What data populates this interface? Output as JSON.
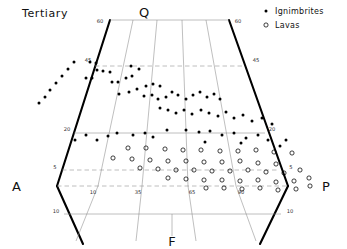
{
  "figure": {
    "title": "Tertiary",
    "type": "qapf-ternary-double-triangle"
  },
  "corners": {
    "q": "Q",
    "a": "A",
    "p": "P",
    "f": "F"
  },
  "legend": {
    "position": "top-right",
    "entries": [
      {
        "label": "Ignimbrites",
        "marker": "filled-dot",
        "color": "#000000"
      },
      {
        "label": "Lavas",
        "marker": "open-circle",
        "color": "#000000"
      }
    ]
  },
  "axis_ticks": {
    "top_left": "60",
    "top_right": "60",
    "left_upper": "45",
    "left_mid": "20",
    "left_lower": "5",
    "left_bottom": "10",
    "right_upper": "45",
    "right_mid": "20",
    "right_lower": "5",
    "right_bottom": "10",
    "inner_left": "10",
    "inner_mid_left": "35",
    "inner_mid_right": "65",
    "inner_right": "90"
  },
  "chart_data": {
    "type": "scatter",
    "title": "Tertiary",
    "xlabel": "",
    "ylabel": "",
    "grid": true,
    "axis_system": "QAPF ternary (Streckeisen)",
    "tick_labels": [
      "60",
      "45",
      "20",
      "5",
      "10",
      "35",
      "65",
      "90"
    ],
    "series": [
      {
        "name": "Ignimbrites",
        "marker": "filled-dot",
        "count": 52,
        "points": [
          [
            39,
            103
          ],
          [
            45,
            97
          ],
          [
            50,
            90
          ],
          [
            56,
            83
          ],
          [
            62,
            76
          ],
          [
            68,
            69
          ],
          [
            74,
            62
          ],
          [
            90,
            62
          ],
          [
            96,
            63
          ],
          [
            97,
            70
          ],
          [
            103,
            71
          ],
          [
            110,
            72
          ],
          [
            86,
            78
          ],
          [
            92,
            78
          ],
          [
            112,
            82
          ],
          [
            118,
            82
          ],
          [
            126,
            78
          ],
          [
            132,
            76
          ],
          [
            131,
            66
          ],
          [
            139,
            69
          ],
          [
            119,
            94
          ],
          [
            129,
            92
          ],
          [
            137,
            89
          ],
          [
            146,
            86
          ],
          [
            153,
            84
          ],
          [
            160,
            86
          ],
          [
            144,
            96
          ],
          [
            152,
            95
          ],
          [
            158,
            99
          ],
          [
            166,
            97
          ],
          [
            172,
            92
          ],
          [
            178,
            95
          ],
          [
            186,
            99
          ],
          [
            193,
            95
          ],
          [
            200,
            92
          ],
          [
            207,
            97
          ],
          [
            214,
            94
          ],
          [
            220,
            99
          ],
          [
            160,
            108
          ],
          [
            168,
            110
          ],
          [
            176,
            113
          ],
          [
            184,
            110
          ],
          [
            192,
            114
          ],
          [
            201,
            110
          ],
          [
            209,
            113
          ],
          [
            218,
            116
          ],
          [
            226,
            112
          ],
          [
            234,
            118
          ],
          [
            243,
            115
          ],
          [
            252,
            121
          ],
          [
            262,
            118
          ],
          [
            272,
            124
          ],
          [
            286,
            140
          ],
          [
            167,
            130
          ],
          [
            186,
            130
          ],
          [
            199,
            132
          ],
          [
            210,
            131
          ],
          [
            222,
            135
          ],
          [
            234,
            133
          ],
          [
            246,
            138
          ],
          [
            258,
            135
          ],
          [
            268,
            140
          ],
          [
            280,
            146
          ],
          [
            133,
            135
          ],
          [
            145,
            133
          ],
          [
            153,
            137
          ],
          [
            108,
            136
          ],
          [
            117,
            133
          ],
          [
            97,
            140
          ],
          [
            86,
            135
          ],
          [
            75,
            140
          ],
          [
            205,
            142
          ],
          [
            241,
            143
          ]
        ]
      },
      {
        "name": "Lavas",
        "marker": "open-circle",
        "count": 46,
        "points": [
          [
            128,
            148
          ],
          [
            146,
            148
          ],
          [
            165,
            149
          ],
          [
            183,
            150
          ],
          [
            201,
            150
          ],
          [
            220,
            151
          ],
          [
            238,
            151
          ],
          [
            256,
            150
          ],
          [
            274,
            152
          ],
          [
            292,
            153
          ],
          [
            113,
            158
          ],
          [
            132,
            159
          ],
          [
            150,
            160
          ],
          [
            168,
            161
          ],
          [
            186,
            161
          ],
          [
            204,
            162
          ],
          [
            222,
            162
          ],
          [
            240,
            161
          ],
          [
            258,
            163
          ],
          [
            276,
            164
          ],
          [
            140,
            168
          ],
          [
            158,
            169
          ],
          [
            176,
            170
          ],
          [
            194,
            170
          ],
          [
            212,
            171
          ],
          [
            230,
            171
          ],
          [
            248,
            170
          ],
          [
            266,
            172
          ],
          [
            284,
            173
          ],
          [
            300,
            170
          ],
          [
            168,
            178
          ],
          [
            186,
            179
          ],
          [
            204,
            180
          ],
          [
            222,
            180
          ],
          [
            240,
            181
          ],
          [
            258,
            180
          ],
          [
            276,
            182
          ],
          [
            294,
            181
          ],
          [
            309,
            178
          ],
          [
            206,
            188
          ],
          [
            224,
            188
          ],
          [
            242,
            189
          ],
          [
            260,
            188
          ],
          [
            278,
            190
          ],
          [
            296,
            189
          ],
          [
            310,
            186
          ]
        ]
      }
    ]
  }
}
